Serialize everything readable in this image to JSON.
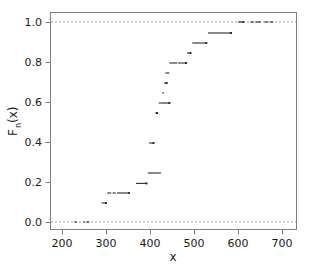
{
  "chart_data": {
    "type": "scatter",
    "title": "",
    "subtitle": "",
    "xlabel": "x",
    "ylabel": "F_n(x)",
    "ylabel_base": "F",
    "ylabel_sub": "n",
    "ylabel_tail": "(x)",
    "xlim": [
      170,
      730
    ],
    "ylim": [
      -0.035,
      1.035
    ],
    "xticks": [
      200,
      300,
      400,
      500,
      600,
      700
    ],
    "xticklabels": [
      "200",
      "300",
      "400",
      "500",
      "600",
      "700"
    ],
    "yticks": [
      0.0,
      0.2,
      0.4,
      0.6,
      0.8,
      1.0
    ],
    "yticklabels": [
      "0.0",
      "0.2",
      "0.4",
      "0.6",
      "0.8",
      "1.0"
    ],
    "grid": false,
    "legend": null,
    "reference_lines": [
      {
        "name": "lower-asymptote",
        "y": 0.0,
        "style": "dashed",
        "color": "#999999"
      },
      {
        "name": "upper-asymptote",
        "y": 1.0,
        "style": "dashed",
        "color": "#999999"
      }
    ],
    "series": [
      {
        "name": "empirical-cdf-steps",
        "marker": "horizontal-segment",
        "color": "#2b2b2b",
        "segments": [
          {
            "x_start": 228,
            "x_end": 234,
            "y": 0.0
          },
          {
            "x_start": 248,
            "x_end": 252,
            "y": 0.0
          },
          {
            "x_start": 255,
            "x_end": 262,
            "y": 0.0
          },
          {
            "x_start": 290,
            "x_end": 300,
            "y": 0.095
          },
          {
            "x_start": 303,
            "x_end": 312,
            "y": 0.145
          },
          {
            "x_start": 315,
            "x_end": 322,
            "y": 0.145
          },
          {
            "x_start": 325,
            "x_end": 352,
            "y": 0.145
          },
          {
            "x_start": 368,
            "x_end": 392,
            "y": 0.193
          },
          {
            "x_start": 395,
            "x_end": 425,
            "y": 0.245
          },
          {
            "x_start": 398,
            "x_end": 408,
            "y": 0.395
          },
          {
            "x_start": 412,
            "x_end": 416,
            "y": 0.545
          },
          {
            "x_start": 420,
            "x_end": 424,
            "y": 0.595
          },
          {
            "x_start": 424,
            "x_end": 444,
            "y": 0.595
          },
          {
            "x_start": 428,
            "x_end": 432,
            "y": 0.645
          },
          {
            "x_start": 432,
            "x_end": 438,
            "y": 0.695
          },
          {
            "x_start": 435,
            "x_end": 444,
            "y": 0.745
          },
          {
            "x_start": 444,
            "x_end": 452,
            "y": 0.795
          },
          {
            "x_start": 452,
            "x_end": 462,
            "y": 0.795
          },
          {
            "x_start": 464,
            "x_end": 472,
            "y": 0.795
          },
          {
            "x_start": 472,
            "x_end": 482,
            "y": 0.795
          },
          {
            "x_start": 484,
            "x_end": 492,
            "y": 0.845
          },
          {
            "x_start": 496,
            "x_end": 528,
            "y": 0.895
          },
          {
            "x_start": 532,
            "x_end": 584,
            "y": 0.945
          },
          {
            "x_start": 600,
            "x_end": 612,
            "y": 1.0
          },
          {
            "x_start": 628,
            "x_end": 636,
            "y": 1.0
          },
          {
            "x_start": 640,
            "x_end": 652,
            "y": 1.0
          },
          {
            "x_start": 660,
            "x_end": 668,
            "y": 1.0
          },
          {
            "x_start": 672,
            "x_end": 680,
            "y": 1.0
          }
        ],
        "endpoint_markers": [
          {
            "x": 300,
            "y": 0.095
          },
          {
            "x": 352,
            "y": 0.145
          },
          {
            "x": 392,
            "y": 0.193
          },
          {
            "x": 408,
            "y": 0.395
          },
          {
            "x": 416,
            "y": 0.545
          },
          {
            "x": 444,
            "y": 0.595
          },
          {
            "x": 438,
            "y": 0.695
          },
          {
            "x": 482,
            "y": 0.795
          },
          {
            "x": 492,
            "y": 0.845
          },
          {
            "x": 528,
            "y": 0.895
          },
          {
            "x": 584,
            "y": 0.945
          },
          {
            "x": 612,
            "y": 1.0
          }
        ]
      }
    ]
  }
}
